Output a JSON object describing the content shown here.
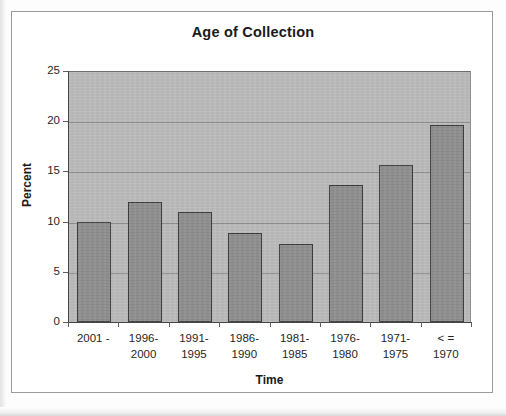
{
  "figure": {
    "title": "Age of Collection",
    "background_color": "#ffffff",
    "plot_background_color": "#b9b9b9",
    "bar_color": "#8d8d8d",
    "bar_border_color": "#3b3b3b",
    "gridline_color": "#8d8d8d",
    "axis_color": "#444444"
  },
  "chart_data": {
    "type": "bar",
    "title": "Age of Collection",
    "xlabel": "Time",
    "ylabel": "Percent",
    "categories": [
      "2001 -",
      "1996-2000",
      "1991-1995",
      "1986-1990",
      "1981-1985",
      "1976-1980",
      "1971-1975",
      "< = 1970"
    ],
    "category_lines": [
      [
        "2001 -"
      ],
      [
        "1996-",
        "2000"
      ],
      [
        "1991-",
        "1995"
      ],
      [
        "1986-",
        "1990"
      ],
      [
        "1981-",
        "1985"
      ],
      [
        "1976-",
        "1980"
      ],
      [
        "1971-",
        "1975"
      ],
      [
        "< =",
        "1970"
      ]
    ],
    "values": [
      10.0,
      12.0,
      11.0,
      8.9,
      7.8,
      13.6,
      15.6,
      19.6
    ],
    "ylim": [
      0,
      25
    ],
    "ytick_labels": [
      "25",
      "20",
      "15",
      "10",
      "5",
      "0"
    ],
    "ytick_values": [
      25,
      20,
      15,
      10,
      5,
      0
    ],
    "grid": true,
    "grid_axis": "y",
    "legend": "none",
    "series": [
      {
        "name": "Percent",
        "values": [
          10.0,
          12.0,
          11.0,
          8.9,
          7.8,
          13.6,
          15.6,
          19.6
        ]
      }
    ]
  }
}
